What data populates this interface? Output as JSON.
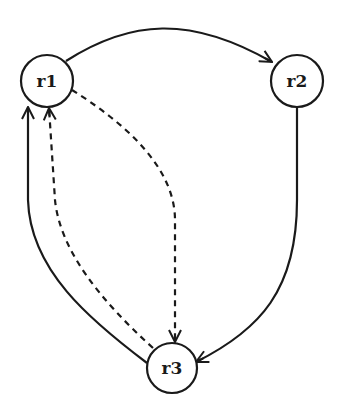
{
  "diagram": {
    "type": "directed-graph",
    "nodes": [
      {
        "id": "r1",
        "label": "r1"
      },
      {
        "id": "r2",
        "label": "r2"
      },
      {
        "id": "r3",
        "label": "r3"
      }
    ],
    "edges": [
      {
        "from": "r1",
        "to": "r2",
        "style": "solid"
      },
      {
        "from": "r2",
        "to": "r3",
        "style": "solid"
      },
      {
        "from": "r3",
        "to": "r1",
        "style": "solid"
      },
      {
        "from": "r1",
        "to": "r3",
        "style": "dashed"
      },
      {
        "from": "r3",
        "to": "r1",
        "style": "dashed"
      }
    ]
  }
}
